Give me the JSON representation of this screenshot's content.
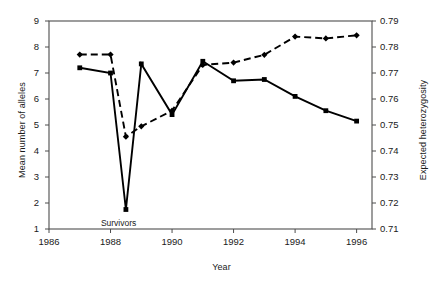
{
  "chart_data": {
    "type": "line",
    "title": "",
    "xlabel": "Year",
    "ylabel": "Mean number of alleles",
    "ylabel_secondary": "Expected heterozygosity",
    "xlim": [
      1986,
      1996.5
    ],
    "ylim": [
      1,
      9
    ],
    "ylim_secondary": [
      0.71,
      0.79
    ],
    "xticks": [
      "1986",
      "1988",
      "1990",
      "1992",
      "1994",
      "1996"
    ],
    "xtick_values": [
      1986,
      1988,
      1990,
      1992,
      1994,
      1996
    ],
    "yticks": [
      "1",
      "2",
      "3",
      "4",
      "5",
      "6",
      "7",
      "8",
      "9"
    ],
    "ytick_values": [
      1,
      2,
      3,
      4,
      5,
      6,
      7,
      8,
      9
    ],
    "yticks_secondary": [
      "0.71",
      "0.72",
      "0.73",
      "0.74",
      "0.75",
      "0.76",
      "0.77",
      "0.78",
      "0.79"
    ],
    "ytick_values_secondary": [
      0.71,
      0.72,
      0.73,
      0.74,
      0.75,
      0.76,
      0.77,
      0.78,
      0.79
    ],
    "grid": false,
    "legend": "none",
    "annotations": [
      {
        "text": "Survivors",
        "x": 1988.5,
        "y": 1.75
      }
    ],
    "series": [
      {
        "name": "Mean number of alleles",
        "axis": "left",
        "style": "solid",
        "marker": "square",
        "color": "#000000",
        "x": [
          1987,
          1988,
          1988.5,
          1989,
          1990,
          1991,
          1992,
          1993,
          1994,
          1995,
          1996
        ],
        "values": [
          7.2,
          7.0,
          1.75,
          7.35,
          5.4,
          7.45,
          6.7,
          6.75,
          6.1,
          5.55,
          5.15
        ]
      },
      {
        "name": "Expected heterozygosity",
        "axis": "right",
        "style": "dashed",
        "marker": "diamond",
        "color": "#000000",
        "x": [
          1987,
          1988,
          1988.5,
          1989,
          1990,
          1991,
          1992,
          1993,
          1994,
          1995,
          1996
        ],
        "values": [
          0.7771,
          0.7771,
          0.7455,
          0.7495,
          0.7555,
          0.7731,
          0.774,
          0.777,
          0.784,
          0.7833,
          0.7845
        ]
      }
    ]
  }
}
